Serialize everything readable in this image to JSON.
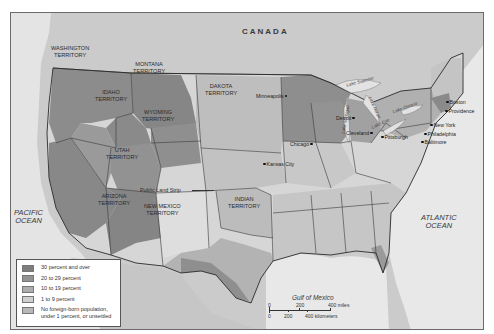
{
  "map": {
    "labels": {
      "country_north": "CANADA",
      "country_south": "MEXICO",
      "ocean_west": "PACIFIC\nOCEAN",
      "ocean_east": "ATLANTIC\nOCEAN",
      "gulf": "Gulf of Mexico",
      "public_land_strip": "Public Land Strip"
    },
    "territories": [
      {
        "id": "washington",
        "label": "WASHINGTON\nTERRITORY"
      },
      {
        "id": "montana",
        "label": "MONTANA\nTERRITORY"
      },
      {
        "id": "idaho",
        "label": "IDAHO\nTERRITORY"
      },
      {
        "id": "dakota",
        "label": "DAKOTA\nTERRITORY"
      },
      {
        "id": "wyoming",
        "label": "WYOMING\nTERRITORY"
      },
      {
        "id": "utah",
        "label": "UTAH\nTERRITORY"
      },
      {
        "id": "arizona",
        "label": "ARIZONA\nTERRITORY"
      },
      {
        "id": "new_mexico",
        "label": "NEW MEXICO\nTERRITORY"
      },
      {
        "id": "indian",
        "label": "INDIAN\nTERRITORY"
      }
    ],
    "cities": [
      {
        "id": "minneapolis",
        "label": "Minneapolis"
      },
      {
        "id": "chicago",
        "label": "Chicago"
      },
      {
        "id": "detroit",
        "label": "Detroit"
      },
      {
        "id": "cleveland",
        "label": "Cleveland"
      },
      {
        "id": "pittsburgh",
        "label": "Pittsburgh"
      },
      {
        "id": "kansas_city",
        "label": "Kansas City"
      },
      {
        "id": "new_york",
        "label": "New York"
      },
      {
        "id": "philadelphia",
        "label": "Philadelphia"
      },
      {
        "id": "baltimore",
        "label": "Baltimore"
      },
      {
        "id": "boston",
        "label": "Boston"
      },
      {
        "id": "providence",
        "label": "Providence"
      }
    ],
    "lakes": [
      {
        "id": "superior",
        "label": "Lake Superior"
      },
      {
        "id": "michigan",
        "label": "Lake Michigan"
      },
      {
        "id": "huron",
        "label": "Lake Huron"
      },
      {
        "id": "erie",
        "label": "Lake Erie"
      },
      {
        "id": "ontario",
        "label": "Lake Ontario"
      }
    ]
  },
  "legend": {
    "items": [
      {
        "label": "30 percent and over",
        "color": "#7d7d7d"
      },
      {
        "label": "20 to 29 percent",
        "color": "#939393"
      },
      {
        "label": "10 to 19 percent",
        "color": "#adadad"
      },
      {
        "label": "1 to 9 percent",
        "color": "#cfcfcf"
      },
      {
        "label": "No foreign-born population,\nunder 1 percent, or unsettled",
        "color": "#b8b8b8"
      }
    ]
  },
  "scale_bar": {
    "miles": {
      "zero": "0",
      "mid": "200",
      "end": "400 miles"
    },
    "km": {
      "zero": "0",
      "mid": "200",
      "end": "400 kilometers"
    }
  },
  "colors": {
    "water": "#e6e6e6",
    "foreign_land": "#c9c9c9",
    "border": "#3a3a3a",
    "frame": "#6b6b6b"
  }
}
